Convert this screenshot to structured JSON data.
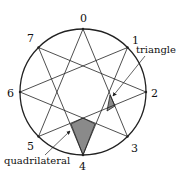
{
  "diagram": {
    "type": "star polygon {8/3} inscribed in circle",
    "point_labels": [
      "0",
      "1",
      "2",
      "3",
      "4",
      "5",
      "6",
      "7"
    ],
    "annotations": {
      "triangle": "triangle",
      "quadrilateral": "quadrilateral"
    },
    "colors": {
      "stroke": "#222222",
      "fill": "#8a8a8a",
      "background": "#ffffff"
    }
  }
}
